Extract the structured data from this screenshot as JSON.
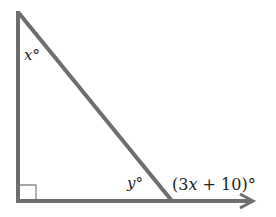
{
  "diagram": {
    "type": "right triangle with exterior angle",
    "colors": {
      "line": "#6e6e6e",
      "text": "#222222"
    },
    "labels": {
      "angle_top": {
        "var": "x",
        "degree": "°"
      },
      "angle_bottom_right": {
        "var": "y",
        "degree": "°"
      },
      "exterior": {
        "open": "(3",
        "var": "x",
        "rest": " + 10)",
        "degree": "°"
      }
    },
    "markers": {
      "right_angle": "bottom-left vertex",
      "arrow": "base ray extends right"
    }
  }
}
